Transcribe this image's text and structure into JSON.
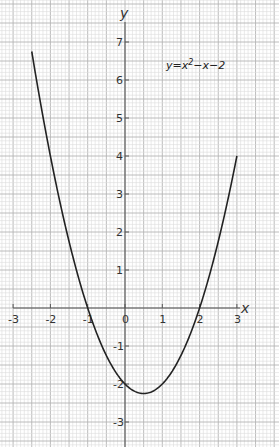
{
  "chart_data": {
    "type": "line",
    "title": "",
    "equation_label": "y=x²−x−2",
    "equation_parts": {
      "lhs": "y=x",
      "exp": "2",
      "rhs": "−x−2"
    },
    "xlabel": "x",
    "ylabel": "y",
    "xlim": [
      -3.2,
      3.4
    ],
    "ylim": [
      -3.6,
      7.9
    ],
    "x_ticks": [
      -3,
      -2,
      -1,
      0,
      1,
      2,
      3
    ],
    "x_tick_labels": [
      "-3",
      "-2",
      "-1",
      "0",
      "1",
      "2",
      "3"
    ],
    "y_ticks": [
      -3,
      -2,
      -1,
      1,
      2,
      3,
      4,
      5,
      6,
      7
    ],
    "y_tick_labels": [
      "-3",
      "-2",
      "-1",
      "1",
      "2",
      "3",
      "4",
      "5",
      "6",
      "7"
    ],
    "grid": {
      "on": true,
      "minor_step": 0.1,
      "major_step": 0.5
    },
    "legend": null,
    "series": [
      {
        "name": "y=x²−x−2",
        "x": [
          -2.5,
          -2,
          -1.5,
          -1,
          -0.5,
          0,
          0.5,
          1,
          1.5,
          2,
          2.5,
          3
        ],
        "y": [
          6.75,
          4,
          1.75,
          0,
          -1.25,
          -2,
          -2.25,
          -2,
          -1.25,
          0,
          1.75,
          4
        ]
      }
    ],
    "curve_range": [
      -2.5,
      3
    ],
    "roots": [
      -1,
      2
    ],
    "vertex": [
      0.5,
      -2.25
    ],
    "y_intercept": -2
  }
}
